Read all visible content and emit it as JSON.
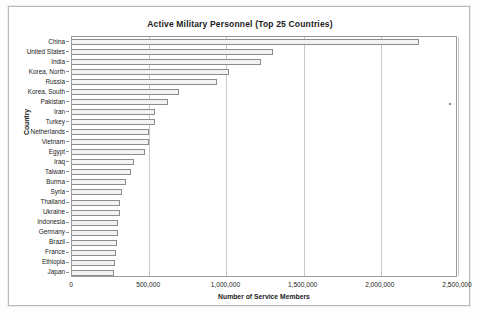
{
  "chart_data": {
    "type": "bar",
    "orientation": "horizontal",
    "title": "Active Military Personnel (Top 25 Countries)",
    "xlabel": "Number of Service Members",
    "ylabel": "Country",
    "xlim": [
      0,
      2500000
    ],
    "xticks": [
      0,
      500000,
      1000000,
      1500000,
      2000000,
      2500000
    ],
    "xticklabels": [
      "0",
      "500,000",
      "1,000,000",
      "1,500,000",
      "2,000,000",
      "2,500,000"
    ],
    "grid": "vertical",
    "legend": "none",
    "bar_fill": "#f2f2f2",
    "bar_edge": "#8c8c8c",
    "categories": [
      "China",
      "United States",
      "India",
      "Korea, North",
      "Russia",
      "Korea, South",
      "Pakistan",
      "Iran",
      "Turkey",
      "Netherlands",
      "Vietnam",
      "Egypt",
      "Iraq",
      "Taiwan",
      "Burma",
      "Syria",
      "Thailand",
      "Ukraine",
      "Indonesia",
      "Germany",
      "Brazil",
      "France",
      "Ethiopia",
      "Japan"
    ],
    "values": [
      2250000,
      1300000,
      1225000,
      1020000,
      940000,
      690000,
      620000,
      535000,
      535000,
      500000,
      500000,
      470000,
      400000,
      380000,
      350000,
      325000,
      310000,
      310000,
      300000,
      295000,
      290000,
      285000,
      280000,
      275000
    ]
  }
}
